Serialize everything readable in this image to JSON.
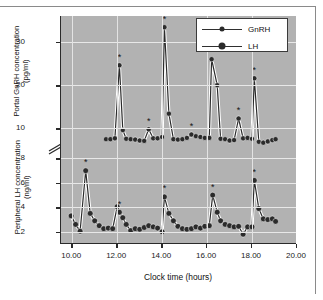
{
  "figure": {
    "xlabel": "Clock time (hours)",
    "ylabel_upper": "Portal GnRH concentration (pg/ml)",
    "ylabel_lower": "Peripheral LH concentration (ng/ml)"
  },
  "legend": {
    "position": "top-right",
    "entries": [
      {
        "label": "GnRH",
        "marker": "small-filled-circle",
        "color": "#2b2b2b"
      },
      {
        "label": "LH",
        "marker": "large-filled-circle",
        "color": "#2b2b2b"
      }
    ]
  },
  "axes": {
    "x_ticks": [
      "10.00",
      "12.00",
      "14.00",
      "16.00",
      "18.00",
      "20.00"
    ],
    "y_ticks_upper": [
      "30",
      "20",
      "10"
    ],
    "y_ticks_lower": [
      "8",
      "6",
      "4",
      "2"
    ],
    "break_symbol": "//"
  },
  "colors": {
    "plot_background": "#b2b2b2",
    "gridline": "#e8e8e8",
    "axis": "#2a2a2a",
    "series": "#2b2b2b",
    "line_outline": "#ffffff",
    "legend_background": "#ffffff",
    "page_background": "#ffffff"
  },
  "chart_data": {
    "type": "line",
    "title": "",
    "subtitle": "",
    "xlabel": "Clock time (hours)",
    "ylabel": "Portal GnRH concentration (pg/ml) / Peripheral LH concentration (ng/ml)",
    "grid": true,
    "legend_position": "top-right",
    "broken_axis": {
      "lower_range": [
        1.0,
        8.6
      ],
      "upper_range": [
        6.6,
        36.0
      ],
      "break_between": [
        8.6,
        6.6
      ],
      "note": "Upper segment uses GnRH pg/ml scale, lower segment uses LH ng/ml scale"
    },
    "axis_ranges": {
      "x": [
        9.5,
        20.0
      ],
      "y_upper_gnrh": [
        6.6,
        36.0
      ],
      "y_lower_lh": [
        1.0,
        8.6
      ]
    },
    "annotations": {
      "symbol": "*",
      "meaning": "significant hormone pulse",
      "gnrh_pulse_times": [
        12.1,
        13.4,
        14.1,
        15.3,
        16.2,
        17.4,
        18.1
      ],
      "lh_pulse_times": [
        10.6,
        12.1,
        14.1,
        16.25,
        18.1
      ]
    },
    "series": [
      {
        "name": "GnRH",
        "unit": "pg/ml",
        "axis": "upper",
        "x": [
          11.5,
          11.7,
          11.9,
          12.1,
          12.25,
          12.4,
          12.6,
          12.8,
          13.0,
          13.2,
          13.4,
          13.6,
          13.8,
          14.0,
          14.1,
          14.3,
          14.5,
          14.7,
          14.9,
          15.1,
          15.3,
          15.5,
          15.7,
          15.9,
          16.1,
          16.2,
          16.45,
          16.6,
          16.8,
          17.0,
          17.2,
          17.4,
          17.6,
          17.8,
          18.0,
          18.1,
          18.3,
          18.5,
          18.7,
          18.9,
          19.05
        ],
        "y": [
          7.5,
          7.5,
          7.7,
          24.6,
          9.6,
          7.6,
          7.5,
          7.4,
          7.2,
          7.1,
          9.8,
          7.7,
          7.7,
          8.0,
          33.4,
          13.4,
          7.5,
          7.4,
          7.5,
          7.8,
          8.6,
          8.2,
          8.0,
          7.8,
          7.8,
          26.0,
          20.0,
          7.6,
          7.5,
          7.2,
          7.3,
          12.3,
          7.7,
          7.8,
          7.6,
          21.6,
          6.9,
          6.7,
          7.0,
          7.3,
          7.5
        ]
      },
      {
        "name": "LH",
        "unit": "ng/ml",
        "axis": "lower",
        "x": [
          9.95,
          10.15,
          10.35,
          10.6,
          10.8,
          11.0,
          11.2,
          11.4,
          11.6,
          11.8,
          12.0,
          12.1,
          12.25,
          12.4,
          12.6,
          12.8,
          13.0,
          13.2,
          13.4,
          13.6,
          13.8,
          14.0,
          14.1,
          14.3,
          14.5,
          14.7,
          14.9,
          15.1,
          15.3,
          15.5,
          15.7,
          15.9,
          16.1,
          16.25,
          16.45,
          16.6,
          16.8,
          17.0,
          17.2,
          17.4,
          17.6,
          17.8,
          18.0,
          18.1,
          18.3,
          18.5,
          18.7,
          18.9,
          19.05
        ],
        "y": [
          3.3,
          2.6,
          2.05,
          7.0,
          3.5,
          2.9,
          2.5,
          2.25,
          2.3,
          2.25,
          4.05,
          3.6,
          3.15,
          2.6,
          2.1,
          2.25,
          2.2,
          2.35,
          2.5,
          2.4,
          2.3,
          2.0,
          4.85,
          3.5,
          2.9,
          2.45,
          2.25,
          2.2,
          2.25,
          2.4,
          2.3,
          2.45,
          2.5,
          5.0,
          3.6,
          2.9,
          2.6,
          2.5,
          2.4,
          2.45,
          1.8,
          2.4,
          2.4,
          6.2,
          3.9,
          3.05,
          3.0,
          3.05,
          2.85
        ]
      }
    ]
  }
}
